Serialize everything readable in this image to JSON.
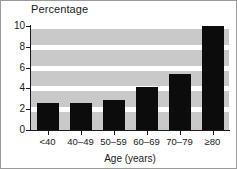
{
  "chart_data": {
    "type": "bar",
    "title": "Percentage",
    "xlabel": "Age (years)",
    "ylabel": "",
    "categories": [
      "<40",
      "40–49",
      "50–59",
      "60–69",
      "70–79",
      "≥80"
    ],
    "values": [
      2.6,
      2.6,
      2.9,
      4.1,
      5.4,
      10.0
    ],
    "ylim": [
      0,
      10
    ],
    "yticks": [
      0,
      2,
      4,
      6,
      8,
      10
    ],
    "ytick_labels": [
      "0",
      "2",
      "4",
      "6",
      "8",
      "10"
    ],
    "grid": true,
    "grid_orientation": "horizontal",
    "legend": null,
    "bar_color": "#0c0c0c",
    "plot_background": "#c9c9c9",
    "gridline_color": "#ffffff"
  }
}
